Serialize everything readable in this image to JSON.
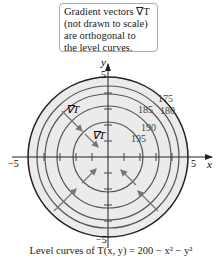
{
  "callout": {
    "lines": [
      "Gradient vectors ∇T",
      "(not drawn to scale)",
      "are orthogonal to",
      "the level curves."
    ]
  },
  "axes": {
    "x_label": "x",
    "y_label": "y",
    "x_min_tick": "−5",
    "x_max_tick": "5",
    "y_min_tick": "−5",
    "y_max_tick": "5"
  },
  "level_labels": [
    "175",
    "180",
    "185",
    "190",
    "195"
  ],
  "gradient_labels": [
    "∇T",
    "∇T"
  ],
  "caption": "Level curves of T(x, y) = 200 − x² − y²",
  "colors": {
    "disk_fill": "#ebebeb",
    "outer_circle": "#222222",
    "level_curves": "#555555",
    "arrows": "#777777"
  }
}
